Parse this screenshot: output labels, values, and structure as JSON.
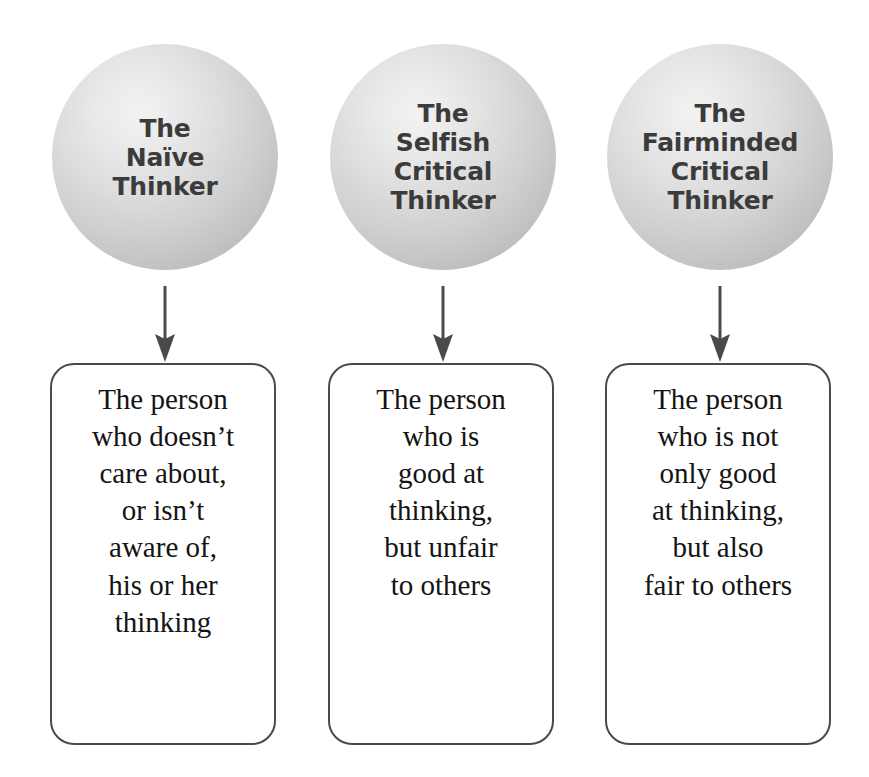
{
  "diagram": {
    "type": "flow-diagram",
    "colors": {
      "circle_fill_light": "#f2f2f2",
      "circle_fill_dark": "#ababab",
      "circle_text": "#3b3b3b",
      "box_border": "#4a4a4a",
      "box_text": "#141414",
      "arrow": "#4a4a4a",
      "background": "#ffffff"
    },
    "nodes": [
      {
        "id": "naive-thinker",
        "circle_label": "The\nNaïve\nThinker",
        "arrow": "down-arrow",
        "box_text": "The person\nwho doesn’t\ncare about,\nor isn’t\naware of,\nhis or her\nthinking"
      },
      {
        "id": "selfish-critical-thinker",
        "circle_label": "The\nSelfish\nCritical\nThinker",
        "arrow": "down-arrow",
        "box_text": "The person\nwho is\ngood at\nthinking,\nbut unfair\nto others"
      },
      {
        "id": "fairminded-critical-thinker",
        "circle_label": "The\nFairminded\nCritical\nThinker",
        "arrow": "down-arrow",
        "box_text": "The person\nwho is not\nonly good\nat thinking,\nbut also\nfair to others"
      }
    ]
  }
}
